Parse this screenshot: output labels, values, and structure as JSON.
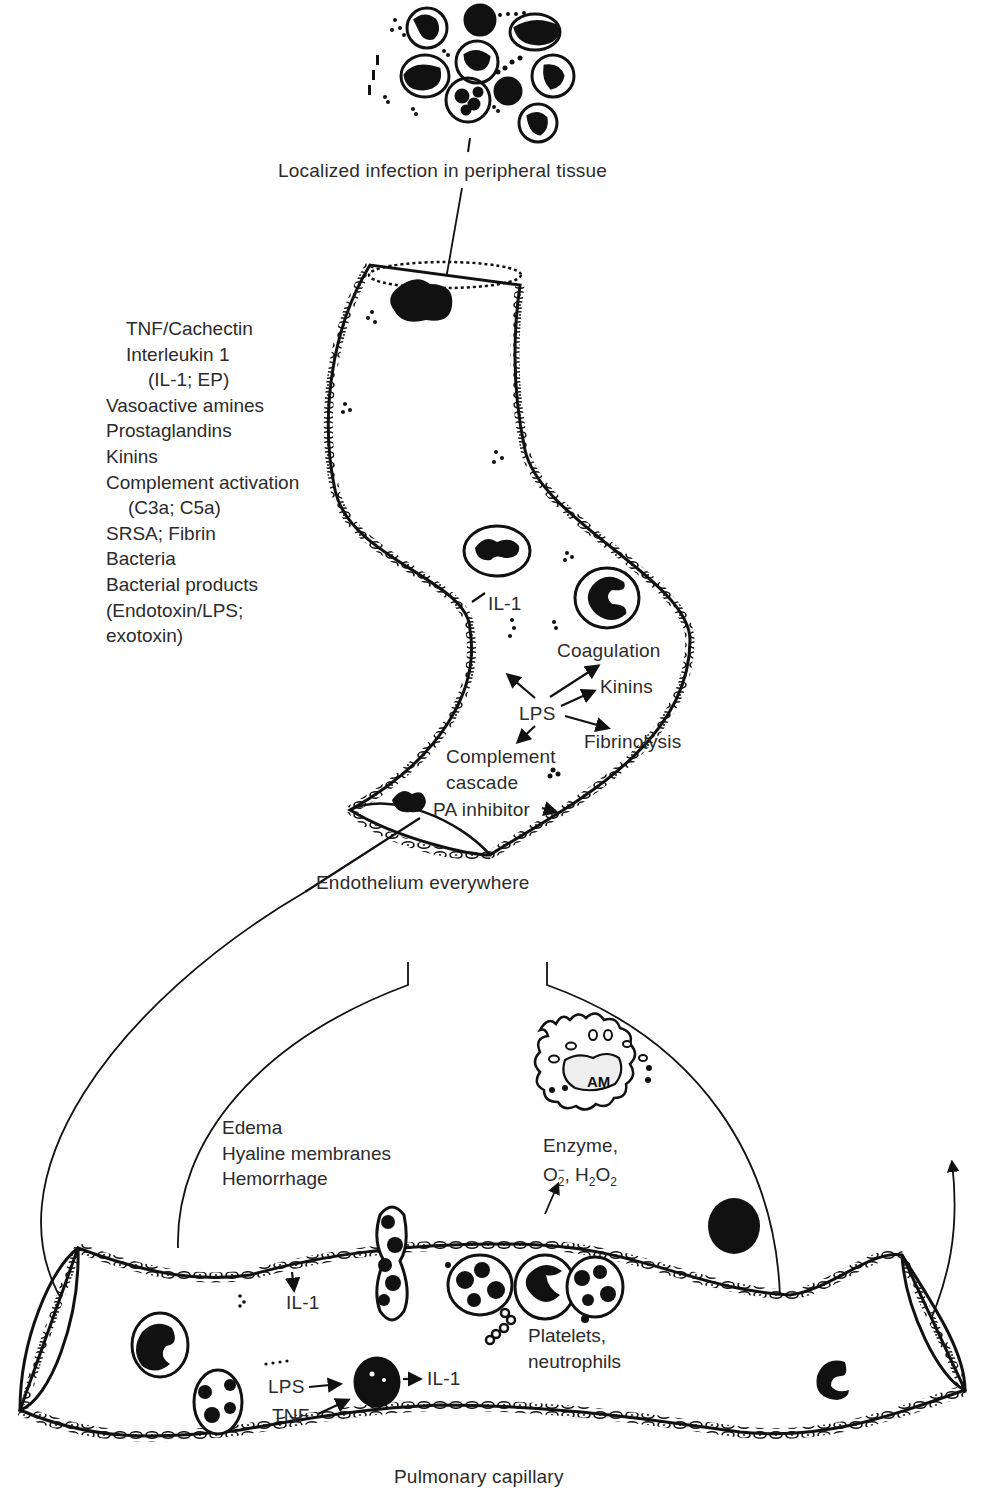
{
  "figure": {
    "colors": {
      "ink": "#111111",
      "text": "#2b2b2b",
      "background": "#ffffff"
    }
  },
  "labels": {
    "infection": "Localized infection in peripheral tissue",
    "endothelium": "Endothelium everywhere",
    "pulmonary_capillary": "Pulmonary capillary",
    "il1_vessel": "IL-1",
    "lps_center": "LPS",
    "coagulation": "Coagulation",
    "kinins": "Kinins",
    "fibrinolysis": "Fibrinolysis",
    "complement_cascade": [
      "Complement",
      "cascade"
    ],
    "pa_inhibitor": "PA inhibitor",
    "alveolar_macrophage": "AM",
    "enzyme": "Enzyme,",
    "oxygen_radical": {
      "base": "O",
      "sub": "2",
      "sup": "−"
    },
    "hydrogen_peroxide": {
      "h": "H",
      "h_sub": "2",
      "o": "O",
      "o_sub": "2"
    },
    "injury_effects": [
      "Edema",
      "Hyaline membranes",
      "Hemorrhage"
    ],
    "il1_capillary_top": "IL-1",
    "platelets": [
      "Platelets,",
      "neutrophils"
    ],
    "dots": "....",
    "lps_capillary": "LPS",
    "tnf_capillary": "TNF",
    "il1_capillary_out": "IL-1"
  },
  "mediators": [
    "TNF/Cachectin",
    "Interleukin 1",
    "(IL-1; EP)",
    "Vasoactive amines",
    "Prostaglandins",
    "Kinins",
    "Complement activation",
    "(C3a; C5a)",
    "SRSA; Fibrin",
    "Bacteria",
    "Bacterial products",
    "(Endotoxin/LPS;",
    "exotoxin)"
  ]
}
